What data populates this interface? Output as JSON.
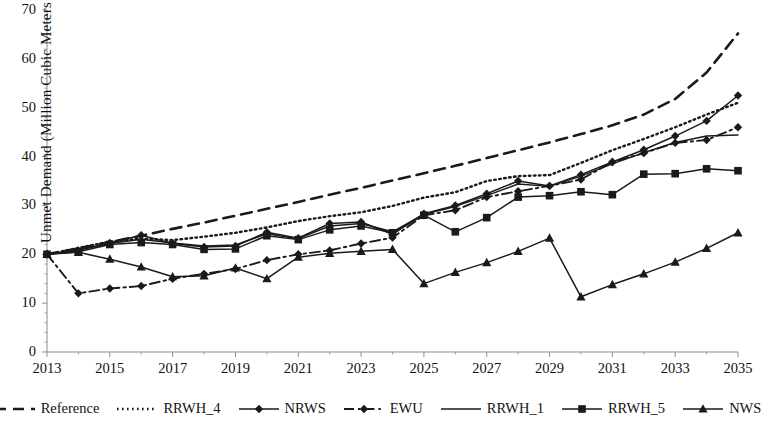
{
  "chart_data": {
    "type": "line",
    "title": "",
    "xlabel": "",
    "ylabel": "Unmet Demand (Million Cubic Meters / year)",
    "xlim": [
      2013,
      2035
    ],
    "ylim": [
      0,
      70
    ],
    "yticks": [
      0,
      10,
      20,
      30,
      40,
      50,
      60,
      70
    ],
    "xticks": [
      2013,
      2015,
      2017,
      2019,
      2021,
      2023,
      2025,
      2027,
      2029,
      2031,
      2033,
      2035
    ],
    "grid": false,
    "legend_position": "bottom",
    "x": [
      2013,
      2014,
      2015,
      2016,
      2017,
      2018,
      2019,
      2020,
      2021,
      2022,
      2023,
      2024,
      2025,
      2026,
      2027,
      2028,
      2029,
      2030,
      2031,
      2032,
      2033,
      2034,
      2035
    ],
    "series": [
      {
        "name": "Reference",
        "style": "dashed",
        "marker": "none",
        "color": "#1a1a1a",
        "values": [
          20.0,
          21.2,
          22.5,
          23.8,
          25.2,
          26.5,
          27.9,
          29.3,
          30.7,
          32.2,
          33.6,
          35.1,
          36.6,
          38.1,
          39.7,
          41.3,
          42.9,
          44.6,
          46.4,
          48.6,
          51.8,
          57.2,
          65.2
        ]
      },
      {
        "name": "RRWH_4",
        "style": "dotted",
        "marker": "none",
        "color": "#1a1a1a",
        "values": [
          20.0,
          21.3,
          22.6,
          23.2,
          22.9,
          23.6,
          24.4,
          25.5,
          26.8,
          27.8,
          28.6,
          29.9,
          31.6,
          32.7,
          35.0,
          36.0,
          36.2,
          38.7,
          41.3,
          43.6,
          46.0,
          48.6,
          51.0
        ]
      },
      {
        "name": "NRWS",
        "style": "solid",
        "marker": "diamond",
        "color": "#1a1a1a",
        "values": [
          20.0,
          20.8,
          22.3,
          23.9,
          22.2,
          21.5,
          21.7,
          24.5,
          23.3,
          26.3,
          26.6,
          24.1,
          28.3,
          30.0,
          32.4,
          35.0,
          34.0,
          36.3,
          38.9,
          41.4,
          44.2,
          47.3,
          52.5
        ]
      },
      {
        "name": "EWU",
        "style": "dashdot",
        "marker": "diamond",
        "color": "#1a1a1a",
        "values": [
          20.0,
          12.0,
          13.0,
          13.5,
          15.0,
          16.0,
          17.0,
          18.8,
          20.0,
          20.8,
          22.2,
          23.4,
          28.0,
          29.0,
          31.7,
          32.9,
          34.0,
          35.3,
          38.9,
          40.7,
          42.8,
          43.4,
          46.0
        ]
      },
      {
        "name": "RRWH_1",
        "style": "solid",
        "marker": "none",
        "color": "#1a1a1a",
        "values": [
          20.0,
          20.9,
          22.2,
          23.1,
          22.3,
          21.7,
          21.9,
          24.2,
          23.2,
          25.8,
          26.3,
          24.6,
          28.2,
          29.8,
          32.0,
          34.4,
          33.9,
          36.0,
          38.5,
          40.8,
          42.9,
          44.2,
          44.4
        ]
      },
      {
        "name": "RRWH_5",
        "style": "solid",
        "marker": "square",
        "color": "#1a1a1a",
        "values": [
          20.0,
          20.5,
          22.0,
          22.4,
          22.0,
          21.0,
          21.1,
          23.8,
          23.0,
          25.0,
          25.8,
          24.4,
          28.0,
          24.6,
          27.5,
          31.7,
          32.0,
          32.8,
          32.2,
          36.4,
          36.5,
          37.5,
          37.1
        ]
      },
      {
        "name": "NWS",
        "style": "solid",
        "marker": "triangle",
        "color": "#1a1a1a",
        "values": [
          20.0,
          20.4,
          19.0,
          17.4,
          15.4,
          15.6,
          17.2,
          15.0,
          19.4,
          20.2,
          20.6,
          21.0,
          14.0,
          16.3,
          18.3,
          20.6,
          23.3,
          11.3,
          13.8,
          16.0,
          18.4,
          21.2,
          24.4
        ]
      }
    ]
  },
  "legend": {
    "items": [
      {
        "label": "Reference",
        "style": "dashed",
        "marker": "none"
      },
      {
        "label": "RRWH_4",
        "style": "dotted",
        "marker": "none"
      },
      {
        "label": "NRWS",
        "style": "solid",
        "marker": "diamond"
      },
      {
        "label": "EWU",
        "style": "dashdot",
        "marker": "diamond"
      },
      {
        "label": "RRWH_1",
        "style": "solid",
        "marker": "none"
      },
      {
        "label": "RRWH_5",
        "style": "solid",
        "marker": "square"
      },
      {
        "label": "NWS",
        "style": "solid",
        "marker": "triangle"
      }
    ]
  },
  "axes": {
    "y_title": "Unmet Demand (Million Cubic Meters / year)",
    "y_tick_labels": [
      "70",
      "60",
      "50",
      "40",
      "30",
      "20",
      "10",
      "0"
    ],
    "x_tick_labels": [
      "2013",
      "2015",
      "2017",
      "2019",
      "2021",
      "2023",
      "2025",
      "2027",
      "2029",
      "2031",
      "2033",
      "2035"
    ]
  },
  "colors": {
    "ink": "#1a1a1a",
    "axis": "#8d8d8d",
    "background": "#ffffff"
  }
}
